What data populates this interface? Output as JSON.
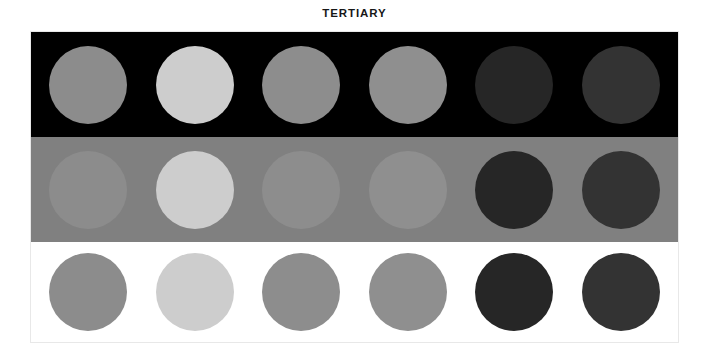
{
  "chart_data": {
    "type": "table",
    "title": "TERTIARY",
    "xlabel": "",
    "ylabel": "",
    "categories": [
      "Swatch 1",
      "Swatch 2",
      "Swatch 3",
      "Swatch 4",
      "Swatch 5",
      "Swatch 6"
    ],
    "series": [
      {
        "name": "On black background",
        "background": "#000000",
        "values": [
          "#8c8c8c",
          "#cdcdcd",
          "#8d8d8d",
          "#8f8f8f",
          "#262626",
          "#333333"
        ]
      },
      {
        "name": "On gray background",
        "background": "#808080",
        "values": [
          "#8c8c8c",
          "#cdcdcd",
          "#8d8d8d",
          "#8f8f8f",
          "#262626",
          "#333333"
        ]
      },
      {
        "name": "On white background",
        "background": "#ffffff",
        "values": [
          "#8c8c8c",
          "#cdcdcd",
          "#8d8d8d",
          "#8f8f8f",
          "#262626",
          "#333333"
        ]
      }
    ],
    "legend_position": "none",
    "grid": false
  },
  "title": "TERTIARY",
  "panel": {
    "border_color": "#e8e8e8",
    "bands": [
      {
        "name": "black-band",
        "background": "#000000",
        "dots": [
          {
            "name": "swatch-1",
            "color": "#8c8c8c"
          },
          {
            "name": "swatch-2",
            "color": "#cdcdcd"
          },
          {
            "name": "swatch-3",
            "color": "#8d8d8d"
          },
          {
            "name": "swatch-4",
            "color": "#8f8f8f"
          },
          {
            "name": "swatch-5",
            "color": "#262626"
          },
          {
            "name": "swatch-6",
            "color": "#333333"
          }
        ]
      },
      {
        "name": "gray-band",
        "background": "#808080",
        "dots": [
          {
            "name": "swatch-1",
            "color": "#8c8c8c"
          },
          {
            "name": "swatch-2",
            "color": "#cdcdcd"
          },
          {
            "name": "swatch-3",
            "color": "#8d8d8d"
          },
          {
            "name": "swatch-4",
            "color": "#8f8f8f"
          },
          {
            "name": "swatch-5",
            "color": "#262626"
          },
          {
            "name": "swatch-6",
            "color": "#333333"
          }
        ]
      },
      {
        "name": "white-band",
        "background": "#ffffff",
        "dots": [
          {
            "name": "swatch-1",
            "color": "#8c8c8c"
          },
          {
            "name": "swatch-2",
            "color": "#cdcdcd"
          },
          {
            "name": "swatch-3",
            "color": "#8d8d8d"
          },
          {
            "name": "swatch-4",
            "color": "#8f8f8f"
          },
          {
            "name": "swatch-5",
            "color": "#262626"
          },
          {
            "name": "swatch-6",
            "color": "#333333"
          }
        ]
      }
    ]
  }
}
